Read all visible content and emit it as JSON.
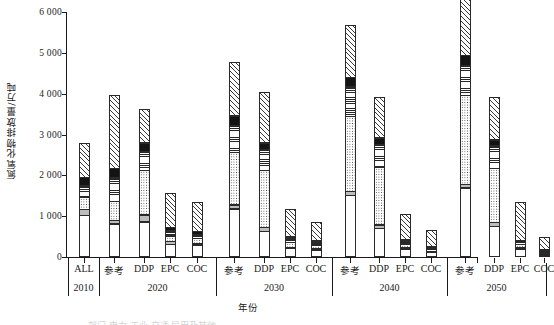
{
  "axes": {
    "ylabel": "氮氧化物排放量/万吨",
    "xlabel": "年份",
    "yticks": [
      "0",
      "1 000",
      "2 000",
      "3 000",
      "4 000",
      "5 000",
      "6 000"
    ],
    "ytick_values": [
      0,
      1000,
      2000,
      3000,
      4000,
      5000,
      6000
    ],
    "ylim": [
      0,
      6000
    ],
    "grid": false,
    "clipped_legend_text": "部门    电力    工业    交通    民用及其他"
  },
  "groups": [
    {
      "year": "2010",
      "scenarios": [
        "ALL"
      ]
    },
    {
      "year": "2020",
      "scenarios": [
        "参考",
        "DDP",
        "EPC",
        "COC"
      ]
    },
    {
      "year": "2030",
      "scenarios": [
        "参考",
        "DDP",
        "EPC",
        "COC"
      ]
    },
    {
      "year": "2040",
      "scenarios": [
        "参考",
        "DDP",
        "EPC",
        "COC"
      ]
    },
    {
      "year": "2050",
      "scenarios": [
        "参考",
        "DDP",
        "EPC",
        "COC"
      ]
    }
  ],
  "chart_data": {
    "type": "bar",
    "stacked": true,
    "title": "",
    "xlabel": "年份",
    "ylabel": "氮氧化物排放量/万吨",
    "ylim": [
      0,
      6000
    ],
    "grid": false,
    "legend_position": "below-clipped",
    "categories": [
      "2010 ALL",
      "2020 参考",
      "2020 DDP",
      "2020 EPC",
      "2020 COC",
      "2030 参考",
      "2030 DDP",
      "2030 EPC",
      "2030 COC",
      "2040 参考",
      "2040 DDP",
      "2040 EPC",
      "2040 COC",
      "2050 参考",
      "2050 DDP",
      "2050 EPC",
      "2050 COC"
    ],
    "series": [
      {
        "name": "s1",
        "pattern": "white",
        "values": [
          1030,
          820,
          860,
          320,
          300,
          1180,
          630,
          210,
          170,
          1520,
          710,
          200,
          115,
          1700,
          760,
          195,
          60
        ]
      },
      {
        "name": "s2",
        "pattern": "light-gray",
        "values": [
          150,
          100,
          190,
          75,
          55,
          120,
          110,
          40,
          35,
          100,
          100,
          30,
          25,
          105,
          110,
          30,
          25
        ]
      },
      {
        "name": "s3",
        "pattern": "dotted",
        "values": [
          330,
          480,
          1100,
          160,
          130,
          1290,
          1410,
          130,
          95,
          1860,
          1430,
          110,
          65,
          2180,
          1340,
          105,
          45
        ]
      },
      {
        "name": "s4",
        "pattern": "horizontal-lines",
        "values": [
          280,
          590,
          480,
          130,
          110,
          680,
          530,
          100,
          85,
          740,
          570,
          85,
          50,
          760,
          560,
          75,
          40
        ]
      },
      {
        "name": "s5",
        "pattern": "black",
        "values": [
          220,
          240,
          230,
          110,
          95,
          250,
          180,
          65,
          55,
          240,
          170,
          55,
          40,
          255,
          160,
          50,
          30
        ]
      },
      {
        "name": "s6",
        "pattern": "diagonal-hatch",
        "values": [
          860,
          1820,
          840,
          840,
          720,
          1340,
          1250,
          700,
          480,
          1300,
          1000,
          620,
          405,
          1520,
          1060,
          955,
          300
        ]
      }
    ],
    "totals": [
      2870,
      4050,
      3700,
      1635,
      1410,
      4860,
      4110,
      1245,
      920,
      5760,
      3980,
      1100,
      700,
      6520,
      3990,
      1410,
      500
    ]
  }
}
